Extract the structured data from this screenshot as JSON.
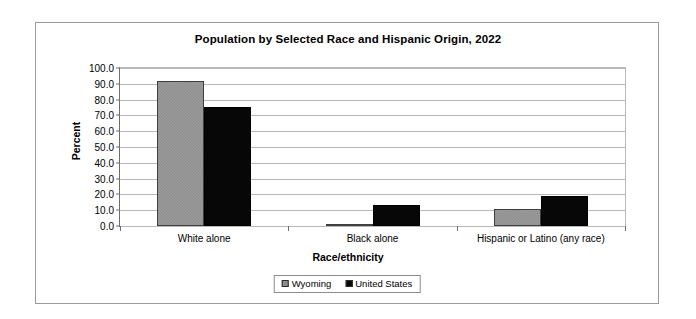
{
  "chart_data": {
    "type": "bar",
    "title": "Population by Selected Race and Hispanic Origin, 2022",
    "xlabel": "Race/ethnicity",
    "ylabel": "Percent",
    "categories": [
      "White alone",
      "Black alone",
      "Hispanic or Latino (any race)"
    ],
    "series": [
      {
        "name": "Wyoming",
        "color": "#8d8d8d",
        "values": [
          91.5,
          1.3,
          10.5
        ]
      },
      {
        "name": "United States",
        "color": "#070707",
        "values": [
          75.5,
          13.6,
          19.1
        ]
      }
    ],
    "ylim": [
      0,
      100
    ],
    "ytick_labels": [
      "100.0",
      "90.0",
      "80.0",
      "70.0",
      "60.0",
      "50.0",
      "40.0",
      "30.0",
      "20.0",
      "10.0",
      "0.0"
    ],
    "ytick_values": [
      100,
      90,
      80,
      70,
      60,
      50,
      40,
      30,
      20,
      10,
      0
    ],
    "grid": true,
    "legend_position": "bottom-center"
  }
}
